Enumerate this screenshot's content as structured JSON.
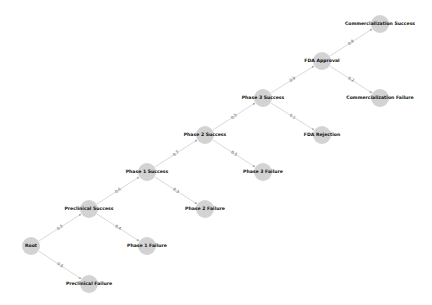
{
  "diagram": {
    "type": "decision-tree",
    "node_color": "#d3d3d3",
    "edge_color": "#c8c8c8",
    "nodes": [
      {
        "id": "root",
        "label": "Root",
        "x": 31,
        "y": 246
      },
      {
        "id": "pre_s",
        "label": "Preclinical Success",
        "x": 89,
        "y": 209
      },
      {
        "id": "pre_f",
        "label": "Preclinical Failure",
        "x": 89,
        "y": 284
      },
      {
        "id": "p1_s",
        "label": "Phase 1 Success",
        "x": 147,
        "y": 172
      },
      {
        "id": "p1_f",
        "label": "Phase 1 Failure",
        "x": 147,
        "y": 246
      },
      {
        "id": "p2_s",
        "label": "Phase 2 Success",
        "x": 205,
        "y": 135
      },
      {
        "id": "p2_f",
        "label": "Phase 2 Failure",
        "x": 205,
        "y": 209
      },
      {
        "id": "p3_s",
        "label": "Phase 3 Success",
        "x": 263,
        "y": 98
      },
      {
        "id": "p3_f",
        "label": "Phase 3 Failure",
        "x": 263,
        "y": 172
      },
      {
        "id": "fda_a",
        "label": "FDA Approval",
        "x": 322,
        "y": 61
      },
      {
        "id": "fda_r",
        "label": "FDA Rejection",
        "x": 322,
        "y": 135
      },
      {
        "id": "com_s",
        "label": "Commercialization Success",
        "x": 380,
        "y": 24
      },
      {
        "id": "com_f",
        "label": "Commercialization Failure",
        "x": 380,
        "y": 98
      }
    ],
    "edges": [
      {
        "from": "root",
        "to": "pre_s",
        "label": "0.5"
      },
      {
        "from": "root",
        "to": "pre_f",
        "label": "0.5"
      },
      {
        "from": "pre_s",
        "to": "p1_s",
        "label": "0.6"
      },
      {
        "from": "pre_s",
        "to": "p1_f",
        "label": "0.4"
      },
      {
        "from": "p1_s",
        "to": "p2_s",
        "label": "0.7"
      },
      {
        "from": "p1_s",
        "to": "p2_f",
        "label": "0.3"
      },
      {
        "from": "p2_s",
        "to": "p3_s",
        "label": "0.5"
      },
      {
        "from": "p2_s",
        "to": "p3_f",
        "label": "0.5"
      },
      {
        "from": "p3_s",
        "to": "fda_a",
        "label": "0.9"
      },
      {
        "from": "p3_s",
        "to": "fda_r",
        "label": "0.1"
      },
      {
        "from": "fda_a",
        "to": "com_s",
        "label": "0.8"
      },
      {
        "from": "fda_a",
        "to": "com_f",
        "label": "0.2"
      }
    ]
  }
}
